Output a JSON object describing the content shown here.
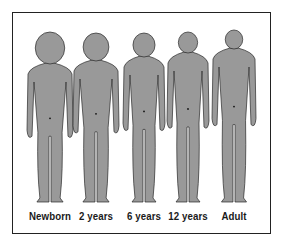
{
  "diagram": {
    "title": "",
    "figure_fill": "#999999",
    "outline_color": "#2a2a2a",
    "figures": [
      {
        "label": "Newborn",
        "center_x": 50,
        "head_top": 32,
        "head_r": 16,
        "feet_y": 202
      },
      {
        "label": "2 years",
        "center_x": 96,
        "head_top": 33,
        "head_r": 14,
        "feet_y": 202
      },
      {
        "label": "6 years",
        "center_x": 144,
        "head_top": 33,
        "head_r": 12,
        "feet_y": 202
      },
      {
        "label": "12 years",
        "center_x": 188,
        "head_top": 32,
        "head_r": 10.5,
        "feet_y": 202
      },
      {
        "label": "Adult",
        "center_x": 234,
        "head_top": 30,
        "head_r": 9.5,
        "feet_y": 202
      }
    ]
  }
}
